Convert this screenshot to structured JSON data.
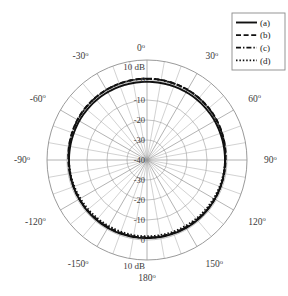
{
  "figure": {
    "kind": "polar-radiation-pattern",
    "background": "#ffffff",
    "grid_color": "#9a9a9a",
    "trace_color": "#111111",
    "text_color": "#3b3b3b"
  },
  "legend": {
    "name": "legend-box",
    "border_color": "#8a8a8a",
    "entries": [
      {
        "label": "(a)",
        "style": "solid",
        "dash": "none",
        "width": 1.9
      },
      {
        "label": "(b)",
        "style": "dashed",
        "dash": "5,2.6",
        "width": 1.9
      },
      {
        "label": "(c)",
        "style": "dashdot",
        "dash": "5,2,1.4,2",
        "width": 1.7
      },
      {
        "label": "(d)",
        "style": "dotted",
        "dash": "1.5,1.9",
        "width": 1.7
      }
    ]
  },
  "chart_data": {
    "type": "line",
    "projection": "polar",
    "title": "",
    "xlabel": "",
    "ylabel": "",
    "runit": "dB",
    "unit_label_top": "10 dB",
    "unit_label_bottom": "10 dB",
    "rlim": [
      -40,
      10
    ],
    "rticks": [
      10,
      0,
      -10,
      -20,
      -30,
      -40
    ],
    "rtick_labels_top": [
      "10 dB",
      "0",
      "-10",
      "-20",
      "-30",
      "-40"
    ],
    "rtick_labels_bottom": [
      "-30",
      "-20",
      "-10",
      "0",
      "10 dB"
    ],
    "grid": true,
    "minor_spoke_step_deg": 10,
    "major_spoke_step_deg": 30,
    "theta_zero_location": "N",
    "theta_direction": "clockwise",
    "angle_ticks_deg": [
      0,
      30,
      60,
      90,
      120,
      150,
      180,
      -150,
      -120,
      -90,
      -60,
      -30
    ],
    "angle_tick_labels": [
      "0º",
      "30º",
      "60º",
      "90º",
      "120º",
      "150º",
      "180º",
      "-150º",
      "-120º",
      "-90º",
      "-60º",
      "-30º"
    ],
    "legend_position": "upper-right",
    "series": [
      {
        "name": "(a)",
        "style": "solid",
        "description": "nearly omnidirectional, level near -0.8 dB",
        "theta_deg": [
          0,
          10,
          20,
          30,
          40,
          50,
          60,
          70,
          80,
          90,
          100,
          110,
          120,
          130,
          140,
          150,
          160,
          170,
          180,
          190,
          200,
          210,
          220,
          230,
          240,
          250,
          260,
          270,
          280,
          290,
          300,
          310,
          320,
          330,
          340,
          350
        ],
        "values_db": [
          -0.9,
          -0.9,
          -0.8,
          -0.8,
          -0.8,
          -0.9,
          -0.9,
          -1.0,
          -1.0,
          -1.0,
          -1.0,
          -0.9,
          -0.9,
          -0.8,
          -0.8,
          -0.8,
          -0.9,
          -0.9,
          -1.0,
          -0.9,
          -0.9,
          -0.8,
          -0.8,
          -0.8,
          -0.9,
          -0.9,
          -1.0,
          -1.0,
          -1.0,
          -1.0,
          -0.9,
          -0.9,
          -0.8,
          -0.8,
          -0.8,
          -0.9
        ]
      },
      {
        "name": "(b)",
        "style": "dashed",
        "description": "slightly higher than (a) on upper half, near +0.6 dB",
        "theta_deg": [
          0,
          10,
          20,
          30,
          40,
          50,
          60,
          70,
          80,
          90,
          100,
          110,
          120,
          130,
          140,
          150,
          160,
          170,
          180,
          190,
          200,
          210,
          220,
          230,
          240,
          250,
          260,
          270,
          280,
          290,
          300,
          310,
          320,
          330,
          340,
          350
        ],
        "values_db": [
          0.7,
          0.7,
          0.6,
          0.6,
          0.5,
          0.4,
          0.2,
          -0.1,
          -0.4,
          -0.7,
          -0.8,
          -0.9,
          -0.9,
          -1.0,
          -1.1,
          -1.2,
          -1.2,
          -1.2,
          -1.2,
          -1.2,
          -1.2,
          -1.2,
          -1.1,
          -1.0,
          -0.9,
          -0.9,
          -0.8,
          -0.7,
          -0.4,
          -0.1,
          0.2,
          0.4,
          0.5,
          0.6,
          0.6,
          0.7
        ]
      },
      {
        "name": "(c)",
        "style": "dashdot",
        "description": "overlays (b) closely on upper half",
        "theta_deg": [
          0,
          10,
          20,
          30,
          40,
          50,
          60,
          70,
          80,
          90,
          100,
          110,
          120,
          130,
          140,
          150,
          160,
          170,
          180,
          190,
          200,
          210,
          220,
          230,
          240,
          250,
          260,
          270,
          280,
          290,
          300,
          310,
          320,
          330,
          340,
          350
        ],
        "values_db": [
          0.6,
          0.6,
          0.6,
          0.5,
          0.4,
          0.3,
          0.1,
          -0.2,
          -0.5,
          -0.8,
          -0.9,
          -0.9,
          -1.0,
          -1.1,
          -1.2,
          -1.2,
          -1.3,
          -1.3,
          -1.3,
          -1.3,
          -1.3,
          -1.2,
          -1.2,
          -1.1,
          -1.0,
          -0.9,
          -0.9,
          -0.8,
          -0.5,
          -0.2,
          0.1,
          0.3,
          0.4,
          0.5,
          0.6,
          0.6
        ]
      },
      {
        "name": "(d)",
        "style": "dotted",
        "description": "tracks (b)/(c) on top, dips slightly inside (a) on bottom",
        "theta_deg": [
          0,
          10,
          20,
          30,
          40,
          50,
          60,
          70,
          80,
          90,
          100,
          110,
          120,
          130,
          140,
          150,
          160,
          170,
          180,
          190,
          200,
          210,
          220,
          230,
          240,
          250,
          260,
          270,
          280,
          290,
          300,
          310,
          320,
          330,
          340,
          350
        ],
        "values_db": [
          0.6,
          0.6,
          0.5,
          0.5,
          0.4,
          0.2,
          0.0,
          -0.3,
          -0.7,
          -1.0,
          -1.2,
          -1.4,
          -1.6,
          -1.7,
          -1.8,
          -1.9,
          -1.9,
          -1.9,
          -1.9,
          -1.9,
          -1.9,
          -1.9,
          -1.8,
          -1.7,
          -1.6,
          -1.4,
          -1.2,
          -1.0,
          -0.7,
          -0.3,
          0.0,
          0.2,
          0.4,
          0.5,
          0.5,
          0.6
        ]
      }
    ]
  }
}
